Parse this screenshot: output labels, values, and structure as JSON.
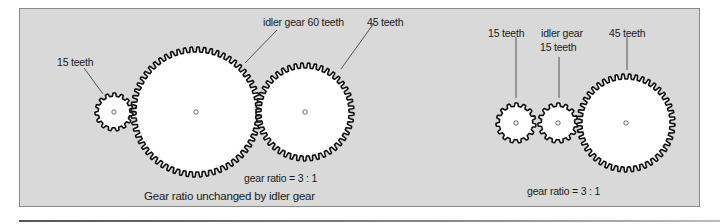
{
  "diagram": {
    "left_example": {
      "labels": {
        "driver": "15 teeth",
        "idler": "idler gear 60 teeth",
        "driven": "45 teeth",
        "ratio": "gear ratio = 3 : 1",
        "caption": "Gear ratio unchanged by idler gear"
      },
      "gears": [
        {
          "name": "driver",
          "teeth": 15,
          "cx": 114,
          "cy": 112,
          "r": 19
        },
        {
          "name": "idler",
          "teeth": 60,
          "cx": 196,
          "cy": 112,
          "r": 65
        },
        {
          "name": "driven",
          "teeth": 45,
          "cx": 305,
          "cy": 112,
          "r": 49
        }
      ]
    },
    "right_example": {
      "labels": {
        "driver": "15 teeth",
        "idler_line1": "idler gear",
        "idler_line2": "15 teeth",
        "driven": "45 teeth",
        "ratio": "gear ratio = 3 : 1"
      },
      "gears": [
        {
          "name": "driver",
          "teeth": 15,
          "cx": 516,
          "cy": 123,
          "r": 20
        },
        {
          "name": "idler",
          "teeth": 15,
          "cx": 558,
          "cy": 123,
          "r": 20
        },
        {
          "name": "driven",
          "teeth": 45,
          "cx": 626,
          "cy": 123,
          "r": 49
        }
      ]
    },
    "colors": {
      "panel_background": "#d9d9d9",
      "gear_fill": "#ffffff",
      "gear_outline": "#111111",
      "leader_line": "#333333"
    }
  }
}
